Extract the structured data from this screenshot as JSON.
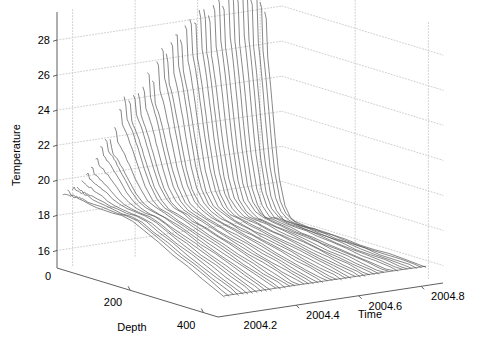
{
  "chart_data": {
    "type": "line",
    "subtype": "3d-waterfall-mesh",
    "title": "",
    "xlabel": "Depth",
    "ylabel": "Time",
    "zlabel": "Temperature",
    "axes": {
      "depth": {
        "label": "Depth",
        "ticks": [
          0,
          200,
          400
        ],
        "tick_labels": [
          "0",
          "200",
          "400"
        ],
        "range": [
          0,
          440
        ]
      },
      "time": {
        "label": "Time",
        "ticks": [
          2004.2,
          2004.4,
          2004.6,
          2004.8
        ],
        "tick_labels": [
          "2004.2",
          "2004.4",
          "2004.6",
          "2004.8"
        ],
        "range": [
          2004.15,
          2004.87
        ]
      },
      "temperature": {
        "label": "Temperature",
        "ticks": [
          16,
          18,
          20,
          22,
          24,
          26,
          28
        ],
        "tick_labels": [
          "16",
          "18",
          "20",
          "22",
          "24",
          "26",
          "28"
        ],
        "range": [
          15.0,
          29.6
        ]
      }
    },
    "grid": true,
    "grid_style": "dotted",
    "legend": "none",
    "line_color": "#555555",
    "grid_color": "#c8c8c8",
    "axis_color": "#4d4d4d",
    "series_note": "One profile line per time slice; temperature vs depth; surface temp rises from ~19 to ~29 then falls; deep water cools to ~16.",
    "n_profiles": 44,
    "depth_samples": [
      0,
      10,
      20,
      30,
      40,
      55,
      70,
      90,
      110,
      135,
      160,
      190,
      220,
      260,
      300,
      340,
      380,
      420,
      440
    ],
    "profiles": [
      {
        "time": 2004.17,
        "surface_temp": 19.3,
        "deep_temp": 18.9,
        "thermo_depth": 180
      },
      {
        "time": 2004.185,
        "surface_temp": 19.2,
        "deep_temp": 18.9,
        "thermo_depth": 180
      },
      {
        "time": 2004.2,
        "surface_temp": 19.5,
        "deep_temp": 18.8,
        "thermo_depth": 175
      },
      {
        "time": 2004.215,
        "surface_temp": 19.4,
        "deep_temp": 18.8,
        "thermo_depth": 172
      },
      {
        "time": 2004.23,
        "surface_temp": 19.8,
        "deep_temp": 18.7,
        "thermo_depth": 170
      },
      {
        "time": 2004.245,
        "surface_temp": 20.1,
        "deep_temp": 18.7,
        "thermo_depth": 168
      },
      {
        "time": 2004.26,
        "surface_temp": 20.4,
        "deep_temp": 18.6,
        "thermo_depth": 165
      },
      {
        "time": 2004.275,
        "surface_temp": 21.0,
        "deep_temp": 18.6,
        "thermo_depth": 162
      },
      {
        "time": 2004.29,
        "surface_temp": 21.6,
        "deep_temp": 18.5,
        "thermo_depth": 158
      },
      {
        "time": 2004.305,
        "surface_temp": 21.9,
        "deep_temp": 18.5,
        "thermo_depth": 155
      },
      {
        "time": 2004.32,
        "surface_temp": 21.7,
        "deep_temp": 18.4,
        "thermo_depth": 152
      },
      {
        "time": 2004.335,
        "surface_temp": 22.4,
        "deep_temp": 18.4,
        "thermo_depth": 150
      },
      {
        "time": 2004.35,
        "surface_temp": 23.6,
        "deep_temp": 18.3,
        "thermo_depth": 146
      },
      {
        "time": 2004.365,
        "surface_temp": 24.0,
        "deep_temp": 18.3,
        "thermo_depth": 143
      },
      {
        "time": 2004.38,
        "surface_temp": 23.8,
        "deep_temp": 18.2,
        "thermo_depth": 140
      },
      {
        "time": 2004.395,
        "surface_temp": 24.2,
        "deep_temp": 18.2,
        "thermo_depth": 138
      },
      {
        "time": 2004.41,
        "surface_temp": 24.1,
        "deep_temp": 18.1,
        "thermo_depth": 135
      },
      {
        "time": 2004.425,
        "surface_temp": 24.6,
        "deep_temp": 18.1,
        "thermo_depth": 132
      },
      {
        "time": 2004.44,
        "surface_temp": 25.3,
        "deep_temp": 18.0,
        "thermo_depth": 130
      },
      {
        "time": 2004.455,
        "surface_temp": 24.9,
        "deep_temp": 18.0,
        "thermo_depth": 128
      },
      {
        "time": 2004.47,
        "surface_temp": 25.8,
        "deep_temp": 17.9,
        "thermo_depth": 125
      },
      {
        "time": 2004.485,
        "surface_temp": 26.6,
        "deep_temp": 17.9,
        "thermo_depth": 122
      },
      {
        "time": 2004.5,
        "surface_temp": 26.2,
        "deep_temp": 17.8,
        "thermo_depth": 120
      },
      {
        "time": 2004.515,
        "surface_temp": 26.9,
        "deep_temp": 17.8,
        "thermo_depth": 118
      },
      {
        "time": 2004.53,
        "surface_temp": 27.4,
        "deep_temp": 17.7,
        "thermo_depth": 115
      },
      {
        "time": 2004.545,
        "surface_temp": 27.0,
        "deep_temp": 17.7,
        "thermo_depth": 112
      },
      {
        "time": 2004.56,
        "surface_temp": 27.7,
        "deep_temp": 17.6,
        "thermo_depth": 110
      },
      {
        "time": 2004.575,
        "surface_temp": 28.2,
        "deep_temp": 17.6,
        "thermo_depth": 108
      },
      {
        "time": 2004.59,
        "surface_temp": 27.9,
        "deep_temp": 17.5,
        "thermo_depth": 105
      },
      {
        "time": 2004.605,
        "surface_temp": 28.5,
        "deep_temp": 17.5,
        "thermo_depth": 103
      },
      {
        "time": 2004.62,
        "surface_temp": 28.3,
        "deep_temp": 17.4,
        "thermo_depth": 100
      },
      {
        "time": 2004.635,
        "surface_temp": 28.0,
        "deep_temp": 17.4,
        "thermo_depth": 98
      },
      {
        "time": 2004.65,
        "surface_temp": 28.7,
        "deep_temp": 17.3,
        "thermo_depth": 96
      },
      {
        "time": 2004.665,
        "surface_temp": 29.1,
        "deep_temp": 17.2,
        "thermo_depth": 94
      },
      {
        "time": 2004.68,
        "surface_temp": 28.6,
        "deep_temp": 17.2,
        "thermo_depth": 92
      },
      {
        "time": 2004.695,
        "surface_temp": 29.3,
        "deep_temp": 17.1,
        "thermo_depth": 90
      },
      {
        "time": 2004.71,
        "surface_temp": 29.0,
        "deep_temp": 17.0,
        "thermo_depth": 88
      },
      {
        "time": 2004.725,
        "surface_temp": 28.8,
        "deep_temp": 17.0,
        "thermo_depth": 86
      },
      {
        "time": 2004.74,
        "surface_temp": 29.4,
        "deep_temp": 16.9,
        "thermo_depth": 85
      },
      {
        "time": 2004.755,
        "surface_temp": 29.1,
        "deep_temp": 16.8,
        "thermo_depth": 84
      },
      {
        "time": 2004.77,
        "surface_temp": 28.6,
        "deep_temp": 16.7,
        "thermo_depth": 82
      },
      {
        "time": 2004.785,
        "surface_temp": 28.9,
        "deep_temp": 16.6,
        "thermo_depth": 80
      },
      {
        "time": 2004.8,
        "surface_temp": 28.4,
        "deep_temp": 16.5,
        "thermo_depth": 78
      },
      {
        "time": 2004.815,
        "surface_temp": 27.9,
        "deep_temp": 16.3,
        "thermo_depth": 76
      }
    ]
  },
  "figure": {
    "background": "#ffffff",
    "projection": {
      "origin_px": [
        57,
        268
      ],
      "depth_axis_end_px": [
        218,
        317
      ],
      "time_axis_end_px": [
        443,
        283
      ],
      "z_top_px_at_origin": 12
    }
  }
}
